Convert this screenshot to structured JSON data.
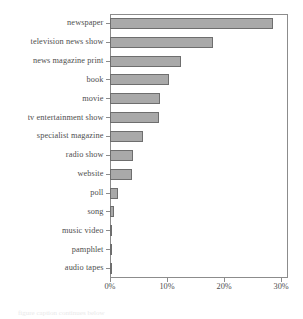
{
  "chart_data": {
    "type": "bar",
    "orientation": "horizontal",
    "title": "",
    "subtitle": "",
    "xlabel": "",
    "ylabel": "",
    "xlim": [
      0,
      31.2
    ],
    "xticks": [
      0,
      10,
      20,
      30
    ],
    "xticklabels": [
      "0%",
      "10%",
      "20%",
      "30%"
    ],
    "grid": false,
    "legend": null,
    "bar_color": "#a9a9a9",
    "bar_edge_color": "#6e6e6e",
    "axis_color": "#8c8c8c",
    "text_color": "#4e4e4e",
    "categories": [
      "newspaper",
      "television news show",
      "news magazine print",
      "book",
      "movie",
      "tv entertainment show",
      "specialist magazine",
      "radio show",
      "website",
      "poll",
      "song",
      "music video",
      "pamphlet",
      "audio tapes"
    ],
    "values": [
      28.6,
      18.1,
      12.5,
      10.4,
      8.8,
      8.6,
      5.8,
      4.0,
      3.9,
      1.4,
      0.7,
      0.35,
      0.25,
      0.25
    ],
    "value_unit": "%"
  },
  "ghost_caption": "figure caption continues below"
}
